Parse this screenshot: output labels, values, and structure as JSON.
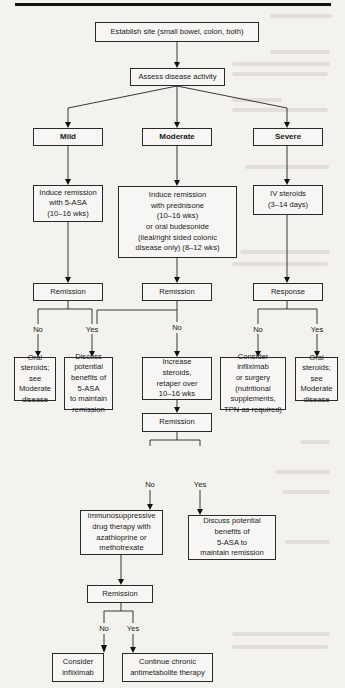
{
  "flowchart": {
    "establish_site": "Establish site (small bowel, colon, both)",
    "assess_activity": "Assess disease activity",
    "severity": {
      "mild": "Mild",
      "moderate": "Moderate",
      "severe": "Severe"
    },
    "induction": {
      "mild": "Induce remission\nwith 5-ASA\n(10–16 wks)",
      "moderate": "Induce remission\nwith prednisone\n(10–16 wks)\nor oral budesonide\n(ileal/right sided colonic\ndisease only) (8–12 wks)",
      "severe": "IV steroids\n(3–14 days)"
    },
    "first_check": {
      "mild": "Remission",
      "moderate": "Remission",
      "severe": "Response"
    },
    "branch_labels": {
      "no": "No",
      "yes": "Yes"
    },
    "outcomes_row1": {
      "mild_no": "Oral\nsteroids;\nsee\nModerate\ndisease",
      "mild_yes": "Discuss\npotential\nbenefits of\n5-ASA\nto maintain\nremission",
      "moderate_no": "Increase\nsteroids,\nretaper over\n10–16 wks",
      "severe_no": "Consider\ninfliximab\nor surgery\n(nutritional\nsupplements,\nTPN as required)",
      "severe_yes": "Oral\nsteroids;\nsee\nModerate\ndisease"
    },
    "second_check": "Remission",
    "outcomes_row2": {
      "no": "Immunosuppressive\ndrug therapy with\nazathioprine or\nmethotrexate",
      "yes": "Discuss potential\nbenefits of\n5-ASA to\nmaintain remission"
    },
    "third_check": "Remission",
    "outcomes_row3": {
      "no": "Consider\ninfliximab",
      "yes": "Continue chronic\nantimetabolite therapy"
    }
  }
}
